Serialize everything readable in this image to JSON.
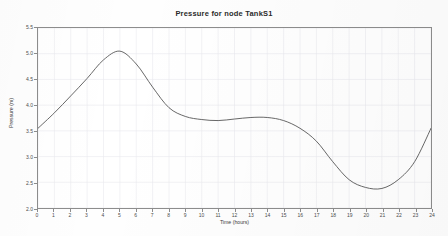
{
  "chart_data": {
    "type": "line",
    "title": "Pressure for node TankS1",
    "xlabel": "Time (hours)",
    "ylabel": "Pressure (m)",
    "xlim": [
      0,
      24
    ],
    "ylim": [
      2.0,
      5.5
    ],
    "grid": true,
    "legend": "none",
    "line_color": "#555555",
    "xticks": [
      "0",
      "1",
      "2",
      "3",
      "4",
      "5",
      "6",
      "7",
      "8",
      "9",
      "10",
      "11",
      "12",
      "13",
      "14",
      "15",
      "16",
      "17",
      "18",
      "19",
      "20",
      "21",
      "22",
      "23",
      "24"
    ],
    "yticks": [
      "5.5",
      "5.0",
      "4.5",
      "4.0",
      "3.5",
      "3.0",
      "2.5",
      "2.0"
    ],
    "x": [
      0,
      1,
      2,
      3,
      4,
      5,
      6,
      7,
      8,
      9,
      10,
      11,
      12,
      13,
      14,
      15,
      16,
      17,
      18,
      19,
      20,
      21,
      22,
      23,
      24
    ],
    "values": [
      3.55,
      3.85,
      4.18,
      4.52,
      4.88,
      5.05,
      4.8,
      4.35,
      3.95,
      3.78,
      3.72,
      3.7,
      3.73,
      3.76,
      3.76,
      3.7,
      3.55,
      3.3,
      2.9,
      2.55,
      2.4,
      2.38,
      2.55,
      2.9,
      3.55
    ],
    "series": [
      {
        "name": "TankS1",
        "values": [
          3.55,
          3.85,
          4.18,
          4.52,
          4.88,
          5.05,
          4.8,
          4.35,
          3.95,
          3.78,
          3.72,
          3.7,
          3.73,
          3.76,
          3.76,
          3.7,
          3.55,
          3.3,
          2.9,
          2.55,
          2.4,
          2.38,
          2.55,
          2.9,
          3.55
        ]
      }
    ]
  }
}
